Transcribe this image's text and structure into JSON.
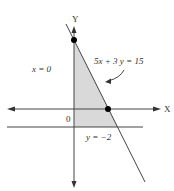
{
  "figure": {
    "axis_labels": {
      "x": "X",
      "y": "Y"
    },
    "origin_label": "0",
    "lines": [
      {
        "id": "x0",
        "label": "x = 0"
      },
      {
        "id": "constraint",
        "label": "5x + 3 y = 15"
      },
      {
        "id": "ym2",
        "label": "y = −2"
      }
    ],
    "points": [
      {
        "name": "y-intercept",
        "coords": "(0, 5)"
      },
      {
        "name": "x-intercept",
        "coords": "(3, 0)"
      }
    ],
    "shaded_region": "feasible region bounded by x = 0, 5x + 3y = 15, y = -2",
    "colors": {
      "shade": "#d9d9d9",
      "line": "#444444",
      "point": "#000000"
    }
  }
}
